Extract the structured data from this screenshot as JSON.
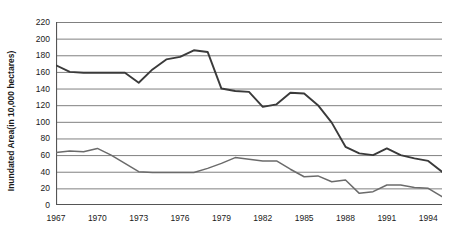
{
  "chart_data": {
    "type": "line",
    "title": "",
    "xlabel": "",
    "ylabel": "Inundated Area(in 10,000 hectares)",
    "ylim": [
      0,
      220
    ],
    "ytick_step": 20,
    "yticks": [
      0,
      20,
      40,
      60,
      80,
      100,
      120,
      140,
      160,
      180,
      200,
      220
    ],
    "xlim": [
      1967,
      1995
    ],
    "xticks": [
      1967,
      1970,
      1973,
      1976,
      1979,
      1982,
      1985,
      1988,
      1991,
      1994
    ],
    "x": [
      1967,
      1968,
      1969,
      1970,
      1971,
      1972,
      1973,
      1974,
      1975,
      1976,
      1977,
      1978,
      1979,
      1980,
      1981,
      1982,
      1983,
      1984,
      1985,
      1986,
      1987,
      1988,
      1989,
      1990,
      1991,
      1992,
      1993,
      1994,
      1995
    ],
    "grid": true,
    "grid_axis": "y",
    "legend": "none",
    "series": [
      {
        "name": "Inundated Area",
        "color": "#3a3a3a",
        "values": [
          168,
          160,
          159,
          159,
          159,
          159,
          147,
          163,
          175,
          178,
          186,
          184,
          140,
          137,
          136,
          118,
          121,
          135,
          134,
          120,
          99,
          70,
          62,
          60,
          68,
          60,
          56,
          53,
          40
        ]
      },
      {
        "name": "Affected Area",
        "color": "#6b6b6b",
        "values": [
          63,
          65,
          64,
          68,
          60,
          50,
          40,
          39,
          39,
          39,
          39,
          44,
          50,
          57,
          55,
          53,
          53,
          43,
          34,
          35,
          28,
          30,
          14,
          16,
          24,
          24,
          21,
          20,
          10
        ]
      }
    ]
  }
}
